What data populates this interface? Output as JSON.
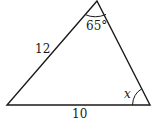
{
  "diagram": {
    "type": "triangle",
    "vertices": {
      "apex": [
        97,
        1
      ],
      "bottom_left": [
        7,
        105
      ],
      "bottom_right": [
        150,
        105
      ]
    },
    "sides": {
      "left": "12",
      "bottom": "10"
    },
    "angles": {
      "apex": "65°",
      "bottom_right": "x"
    },
    "colors": {
      "stroke": "#1a1a1a",
      "background": "#ffffff"
    }
  }
}
